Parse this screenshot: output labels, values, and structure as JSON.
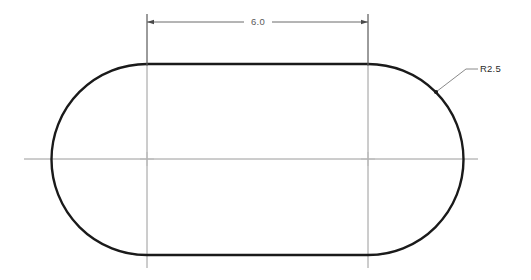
{
  "drawing": {
    "title": "Slot profile with rounded ends",
    "background_color": "#ffffff",
    "outline_color": "#1a1a1a",
    "centerline_color": "#9a9a9a",
    "dimension_color": "#6b6b6b",
    "leader_color": "#8a8a8a",
    "shape": {
      "type": "obround-slot",
      "left_arc_center": {
        "x": 147,
        "y": 159
      },
      "right_arc_center": {
        "x": 368,
        "y": 159
      },
      "radius_px": 95,
      "top_edge_y": 64,
      "bottom_edge_y": 255,
      "left_extent_x": 52,
      "right_extent_x": 463
    },
    "dimensions": [
      {
        "name": "overall-length",
        "label": "6.0",
        "kind": "linear-horizontal",
        "dimension_line_y": 22,
        "start_x": 147,
        "end_x": 368,
        "text_x": 258,
        "text_y": 25
      },
      {
        "name": "corner-radius",
        "label": "R2.5",
        "kind": "radius-leader",
        "attach_x": 436,
        "attach_y": 92,
        "elbow_x": 466,
        "elbow_y": 69,
        "shelf_end_x": 478,
        "text_x": 480,
        "text_y": 72
      }
    ],
    "centerlines": [
      {
        "name": "horizontal-centerline",
        "y": 159,
        "x1": 24,
        "x2": 478
      },
      {
        "name": "vertical-centerline-left",
        "x": 147,
        "y1": 14,
        "y2": 268
      },
      {
        "name": "vertical-centerline-right",
        "x": 368,
        "y1": 14,
        "y2": 268
      }
    ],
    "center_marks": [
      {
        "name": "center-mark-left",
        "x": 147,
        "y": 159
      },
      {
        "name": "center-mark-right",
        "x": 368,
        "y": 159
      }
    ]
  }
}
